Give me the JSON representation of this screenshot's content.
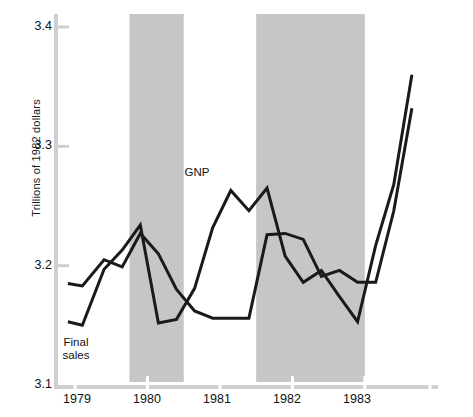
{
  "chart_data": {
    "type": "line",
    "title": "",
    "subtitle": "",
    "xlabel": "",
    "ylabel": "Trillions of 1982 dollars",
    "ylim": [
      3.1,
      3.4
    ],
    "xlim": [
      1978.75,
      1983.9
    ],
    "grid": false,
    "legend_position": "inline-annotation",
    "y_ticks": [
      "3.1",
      "3.2",
      "3.3",
      "3.4"
    ],
    "y_tick_values": [
      3.1,
      3.2,
      3.3,
      3.4
    ],
    "x_ticks": [
      "1979",
      "1980",
      "1981",
      "1982",
      "1983"
    ],
    "x_tick_values": [
      1979,
      1980,
      1981,
      1982,
      1983
    ],
    "shaded_regions": [
      {
        "label": "recession-1980",
        "start": 1979.75,
        "end": 1980.5
      },
      {
        "label": "recession-1981-82",
        "start": 1981.5,
        "end": 1983.0
      }
    ],
    "series": [
      {
        "name": "GNP",
        "color": "#1a1a1a",
        "x": [
          1978.9,
          1979.1,
          1979.4,
          1979.65,
          1979.9,
          1980.15,
          1980.4,
          1980.65,
          1980.9,
          1981.15,
          1981.4,
          1981.65,
          1981.9,
          1982.15,
          1982.4,
          1982.65,
          1982.9,
          1983.15,
          1983.4,
          1983.65
        ],
        "y": [
          3.153,
          3.15,
          3.197,
          3.213,
          3.234,
          3.152,
          3.155,
          3.181,
          3.232,
          3.263,
          3.246,
          3.265,
          3.208,
          3.186,
          3.196,
          3.174,
          3.153,
          3.217,
          3.268,
          3.36
        ]
      },
      {
        "name": "Final sales",
        "color": "#1a1a1a",
        "x": [
          1978.9,
          1979.1,
          1979.4,
          1979.65,
          1979.9,
          1980.15,
          1980.4,
          1980.65,
          1980.9,
          1981.15,
          1981.4,
          1981.65,
          1981.9,
          1982.15,
          1982.4,
          1982.65,
          1982.9,
          1983.15,
          1983.4,
          1983.65
        ],
        "y": [
          3.185,
          3.183,
          3.205,
          3.199,
          3.227,
          3.21,
          3.18,
          3.162,
          3.156,
          3.156,
          3.156,
          3.226,
          3.227,
          3.222,
          3.191,
          3.196,
          3.186,
          3.186,
          3.246,
          3.332
        ]
      }
    ],
    "annotations": [
      {
        "text": "GNP",
        "x": 1981.15,
        "y": 3.281,
        "name": "gnp-series-label"
      },
      {
        "text": "Final\nsales",
        "x": 1979.2,
        "y": 3.125,
        "name": "final-sales-series-label"
      }
    ],
    "colors": {
      "line": "#1a1a1a",
      "shaded_band": "#c6c6c6",
      "axis": "#cfcfcf",
      "background": "#ffffff",
      "text": "#111111"
    }
  }
}
